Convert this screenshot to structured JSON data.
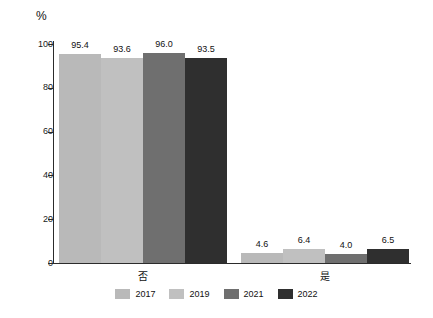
{
  "chart_data": {
    "type": "bar",
    "title": "",
    "xlabel": "",
    "ylabel": "%",
    "unit_label": "%",
    "ylim": [
      0,
      100
    ],
    "yticks": [
      0,
      20,
      40,
      60,
      80,
      100
    ],
    "ytick_labels": [
      "0",
      "20",
      "40",
      "60",
      "80",
      "100"
    ],
    "grid": false,
    "legend_position": "bottom",
    "categories": [
      "否",
      "是"
    ],
    "series": [
      {
        "name": "2017",
        "color": "#b9b9b9",
        "values": [
          95.4,
          4.6
        ],
        "value_labels": [
          "95.4",
          "4.6"
        ]
      },
      {
        "name": "2019",
        "color": "#c0c0c0",
        "values": [
          93.6,
          6.4
        ],
        "value_labels": [
          "93.6",
          "6.4"
        ]
      },
      {
        "name": "2021",
        "color": "#6f6f6f",
        "values": [
          96.0,
          4.0
        ],
        "value_labels": [
          "96.0",
          "4.0"
        ]
      },
      {
        "name": "2022",
        "color": "#2f2f2f",
        "values": [
          93.5,
          6.5
        ],
        "value_labels": [
          "93.5",
          "6.5"
        ]
      }
    ]
  },
  "axis": {
    "unit": "%",
    "ticks": [
      {
        "label": "100",
        "value": 100
      },
      {
        "label": "80",
        "value": 80
      },
      {
        "label": "60",
        "value": 60
      },
      {
        "label": "40",
        "value": 40
      },
      {
        "label": "20",
        "value": 20
      },
      {
        "label": "0",
        "value": 0
      }
    ]
  },
  "categories": [
    {
      "label": "否"
    },
    {
      "label": "是"
    }
  ],
  "legend": {
    "items": [
      {
        "label": "2017",
        "color": "#b9b9b9"
      },
      {
        "label": "2019",
        "color": "#c0c0c0"
      },
      {
        "label": "2021",
        "color": "#6f6f6f"
      },
      {
        "label": "2022",
        "color": "#2f2f2f"
      }
    ]
  }
}
